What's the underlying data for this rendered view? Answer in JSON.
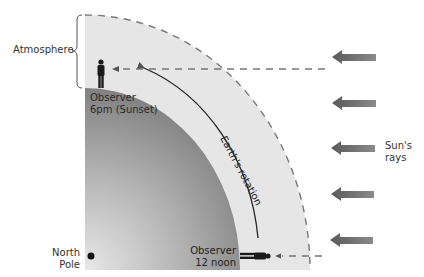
{
  "diagram": {
    "type": "sunset-earth-rotation",
    "colors": {
      "atmosphere": "#e6e6e6",
      "earth_light": "#d0d0d0",
      "earth_dark": "#7a7a7a",
      "arrow": "#6a6a6a",
      "dash": "#777777",
      "text": "#333333"
    },
    "labels": {
      "atmosphere": "Atmosphere",
      "observer_sunset_line1": "Observer",
      "observer_sunset_line2": "6pm (Sunset)",
      "observer_noon_line1": "Observer",
      "observer_noon_line2": "12 noon",
      "earth_rotation": "Earth's rotation",
      "sun_rays_line1": "Sun's",
      "sun_rays_line2": "rays",
      "north_pole_line1": "North",
      "north_pole_line2": "Pole"
    },
    "sun_ray_arrows": [
      {
        "y": 57
      },
      {
        "y": 103
      },
      {
        "y": 148
      },
      {
        "y": 194
      },
      {
        "y": 240
      }
    ]
  }
}
